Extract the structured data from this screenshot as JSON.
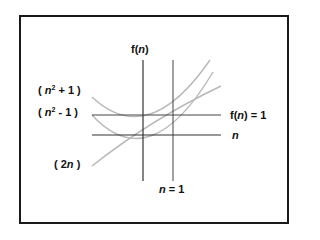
{
  "diagram": {
    "axes": {
      "y_label_prefix": "f(",
      "y_label_var": "n",
      "y_label_suffix": ")",
      "x_label": "n"
    },
    "reference_lines": {
      "horizontal_label_prefix": "f(",
      "horizontal_label_var": "n",
      "horizontal_label_suffix": ") = 1",
      "vertical_label_var": "n",
      "vertical_label_suffix": " = 1"
    },
    "curves": [
      {
        "id": "n2plus1",
        "label_open": "( ",
        "label_var": "n",
        "label_exp": "2",
        "label_rest": " + 1 )"
      },
      {
        "id": "n2minus1",
        "label_open": "( ",
        "label_var": "n",
        "label_exp": "2",
        "label_rest": " - 1 )"
      },
      {
        "id": "2n",
        "label_open": "( 2",
        "label_var": "n",
        "label_rest": " )"
      }
    ],
    "colors": {
      "axis": "#333333",
      "curve": "#b8b8b8",
      "frame": "#1a1a1a"
    }
  }
}
